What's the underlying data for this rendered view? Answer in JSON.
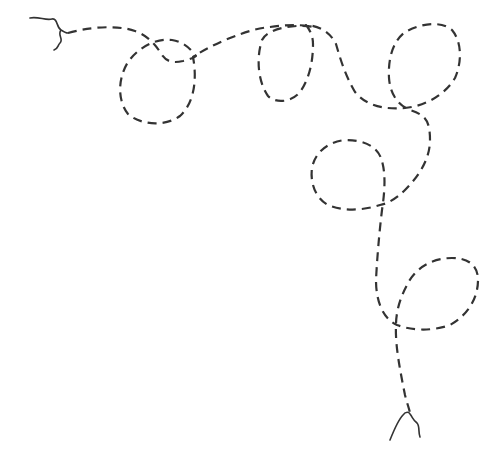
{
  "canvas": {
    "width": 499,
    "height": 454,
    "background": "#ffffff"
  },
  "drawing": {
    "subject": "decorative dashed looping line (corner border ornament)",
    "stroke_color": "#333333",
    "dash_pattern": "9 6",
    "loops_count": 5,
    "start_tail": {
      "style": "solid wavy",
      "path": "M30,18 C38,16 46,21 52,19 C58,18 56,27 61,30 C64,32 66,33 68,33 M61,30 C57,35 64,39 60,43 C57,46 59,48 54,50"
    },
    "main_path": {
      "style": "dashed",
      "path": "M68,33 C85,28 115,24 135,31 C148,36 155,44 160,52 C165,60 170,64 183,61 C190,59 194,58 196,56 C191,50 185,42 172,40 C155,38 138,48 128,62 C118,78 117,100 128,114 C140,125 165,127 180,116 C195,102 197,78 193,57 C200,52 215,44 230,38 C245,32 258,28 270,27 C285,25 300,24 313,27 C305,24 268,26 262,40 C256,58 258,82 268,96 C276,104 292,102 300,92 C310,78 313,60 313,44 C313,36 310,30 306,25 C320,26 330,32 336,44 C340,58 345,75 355,92 C365,104 380,110 405,108 C425,106 445,95 455,78 C462,62 462,42 452,30 C440,20 420,24 405,32 C392,42 388,60 389,78 C390,92 396,104 410,110 C425,115 430,120 430,140 C430,158 420,175 405,190 C395,200 386,204 380,205 C365,210 345,212 328,205 C315,198 310,182 312,168 C315,152 328,142 345,140 C362,140 376,145 381,158 C386,172 385,190 382,210 C379,235 377,260 376,280 C376,300 382,318 397,325 C410,330 430,332 450,325 C468,315 478,298 478,280 C478,265 468,258 452,258 C432,258 415,268 407,285 C400,298 396,312 396,325 C395,345 400,370 405,395 C407,403 409,408 410,413"
    },
    "end_tail": {
      "style": "solid wavy",
      "path": "M390,440 C394,430 398,420 403,415 C406,411 409,412 410,414 C413,418 413,420 417,423 C420,426 418,432 420,437"
    }
  }
}
